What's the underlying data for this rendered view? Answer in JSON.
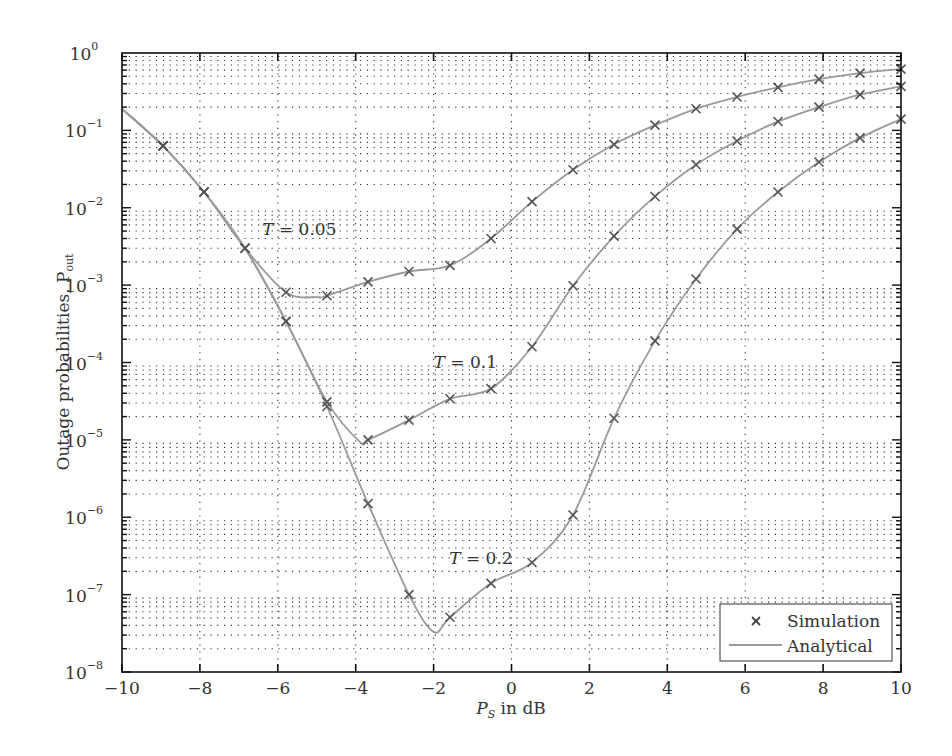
{
  "chart_data": {
    "type": "line",
    "title": "",
    "xlabel": "P_S in dB",
    "xlabel_main": "P",
    "xlabel_sub": "S",
    "xlabel_rest": " in dB",
    "ylabel": "Outage probabilities, P_out",
    "ylabel_main": "Outage probabilities, P",
    "ylabel_sub": "out",
    "xlim": [
      -10,
      10
    ],
    "ylim": [
      1e-08,
      1
    ],
    "yscale": "log",
    "grid": true,
    "x_ticks": [
      -10,
      -8,
      -6,
      -4,
      -2,
      0,
      2,
      4,
      6,
      8,
      10
    ],
    "x_tick_labels": [
      "−10",
      "−8",
      "−6",
      "−4",
      "−2",
      "0",
      "2",
      "4",
      "6",
      "8",
      "10"
    ],
    "y_ticks_exp": [
      0,
      -1,
      -2,
      -3,
      -4,
      -5,
      -6,
      -7,
      -8
    ],
    "y_tick_base": "10",
    "y_tick_sups": [
      "0",
      "−1",
      "−2",
      "−3",
      "−4",
      "−5",
      "−6",
      "−7",
      "−8"
    ],
    "legend": {
      "position": "lower right",
      "entries": [
        {
          "label": "Simulation",
          "marker": "x"
        },
        {
          "label": "Analytical",
          "marker": "line"
        }
      ]
    },
    "x": [
      -10.0,
      -8.947,
      -7.895,
      -6.842,
      -5.789,
      -4.737,
      -3.684,
      -2.632,
      -1.579,
      -0.526,
      0.526,
      1.579,
      2.632,
      3.684,
      4.737,
      5.789,
      6.842,
      7.895,
      8.947,
      10.0
    ],
    "series": [
      {
        "name": "T = 0.05",
        "label": "T = 0.05",
        "label_pos": {
          "x": -6.4,
          "y": 0.0045
        },
        "values": [
          0.19,
          0.063,
          0.016,
          0.003,
          0.00081,
          0.00073,
          0.0011,
          0.0015,
          0.0018,
          0.004,
          0.012,
          0.031,
          0.066,
          0.117,
          0.19,
          0.27,
          0.36,
          0.46,
          0.55,
          0.62
        ]
      },
      {
        "name": "T = 0.1",
        "label": "T = 0.1",
        "label_pos": {
          "x": -2.0,
          "y": 8.5e-05
        },
        "values": [
          0.19,
          0.063,
          0.016,
          0.003,
          0.00034,
          3.1e-05,
          1e-05,
          1.8e-05,
          3.4e-05,
          4.6e-05,
          0.00016,
          0.00098,
          0.0043,
          0.014,
          0.036,
          0.073,
          0.13,
          0.2,
          0.29,
          0.37
        ]
      },
      {
        "name": "T = 0.2",
        "label": "T = 0.2",
        "label_pos": {
          "x": -1.6,
          "y": 2.5e-07
        },
        "values": [
          0.19,
          0.063,
          0.016,
          0.003,
          0.00034,
          2.7e-05,
          1.5e-06,
          1e-07,
          5.1e-08,
          1.4e-07,
          2.6e-07,
          1.07e-06,
          1.9e-05,
          0.00019,
          0.0012,
          0.0053,
          0.016,
          0.039,
          0.08,
          0.14
        ]
      }
    ],
    "analytical_minima": [
      {
        "series": "T = 0.05",
        "x": -5.0,
        "y": 0.0007
      },
      {
        "series": "T = 0.1",
        "x": -3.9,
        "y": 9.5e-06
      },
      {
        "series": "T = 0.2",
        "x": -2.0,
        "y": 3.3e-08
      }
    ]
  },
  "colors": {
    "curve": "#9a9a9a",
    "marker": "#555555",
    "axis": "#111111",
    "grid": "#333333"
  }
}
